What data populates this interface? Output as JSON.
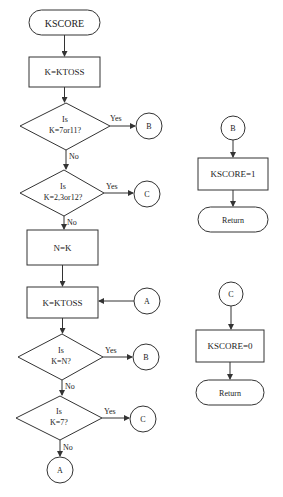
{
  "diagram": {
    "type": "flowchart",
    "main_flow": {
      "start": "KSCORE",
      "step1": "K=KTOSS",
      "decision1": {
        "line1": "Is",
        "line2": "K=7or11?",
        "yes": "Yes",
        "no": "No",
        "yes_target": "B"
      },
      "decision2": {
        "line1": "Is",
        "line2": "K=2,3or12?",
        "yes": "Yes",
        "no": "No",
        "yes_target": "C"
      },
      "step2": "N=K",
      "step3": "K=KTOSS",
      "connector_in": "A",
      "decision3": {
        "line1": "Is",
        "line2": "K=N?",
        "yes": "Yes",
        "no": "No",
        "yes_target": "B"
      },
      "decision4": {
        "line1": "Is",
        "line2": "K=7?",
        "yes": "Yes",
        "no": "No",
        "yes_target": "C"
      },
      "end_connector": "A"
    },
    "branch_b": {
      "connector": "B",
      "step": "KSCORE=1",
      "end": "Return"
    },
    "branch_c": {
      "connector": "C",
      "step": "KSCORE=0",
      "end": "Return"
    }
  }
}
